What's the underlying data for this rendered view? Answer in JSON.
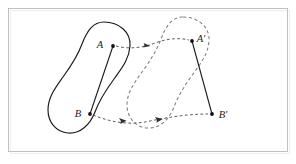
{
  "figure": {
    "type": "geometry-diagram",
    "frame": {
      "stroke": "#c8c8c8",
      "fill": "#ffffff",
      "x": 8,
      "y": 8,
      "width": 280,
      "height": 144
    },
    "colors": {
      "solid_outline": "#1a1a1a",
      "dashed_outline": "#7a7a7a",
      "segment": "#1a1a1a",
      "arrow": "#3a3a3a",
      "point": "#111111",
      "label": "#1a1a1a"
    },
    "labels": {
      "a": "A",
      "b": "B",
      "a_prime": "A′",
      "b_prime": "B′"
    },
    "points": {
      "a": {
        "x": 113,
        "y": 46
      },
      "b": {
        "x": 90,
        "y": 114
      },
      "a_prime": {
        "x": 192,
        "y": 41
      },
      "b_prime": {
        "x": 212,
        "y": 114
      }
    },
    "label_positions": {
      "a": {
        "x": 100,
        "y": 48
      },
      "b": {
        "x": 77,
        "y": 117
      },
      "a_prime": {
        "x": 197,
        "y": 42
      },
      "b_prime": {
        "x": 218,
        "y": 118
      }
    },
    "shapes": {
      "source_blob_path": "M 104 22 C 119 22 131 32 130 46 C 129 60 121 69 114 79 C 106 90 99 101 95 112 C 90 125 80 134 68 133 C 56 132 48 122 48 110 C 48 97 56 87 63 77 C 71 66 78 55 82 44 C 87 31 93 22 104 22 Z",
      "target_blob_path": "M 183 17 C 198 17 210 27 209 41 C 208 55 200 64 193 74 C 185 85 178 96 174 107 C 169 120 159 129 147 128 C 135 127 127 117 127 105 C 127 92 135 82 142 72 C 150 61 157 50 161 39 C 166 26 172 17 183 17 Z",
      "translation_dx": 79,
      "translation_dy": -5
    },
    "arrows": {
      "upper": {
        "from": "A",
        "to": "A′",
        "path": "M 116 46 C 130 50 146 47 158 42 C 170 38 181 38 189 40",
        "arrow_at_t": 0.42
      },
      "lower": {
        "from": "B",
        "to": "B′",
        "path": "M 93 115 C 110 122 128 125 145 122 C 165 118 185 114 208 114",
        "arrow_at_t_1": 0.22,
        "arrow_at_t_2": 0.58
      }
    }
  }
}
